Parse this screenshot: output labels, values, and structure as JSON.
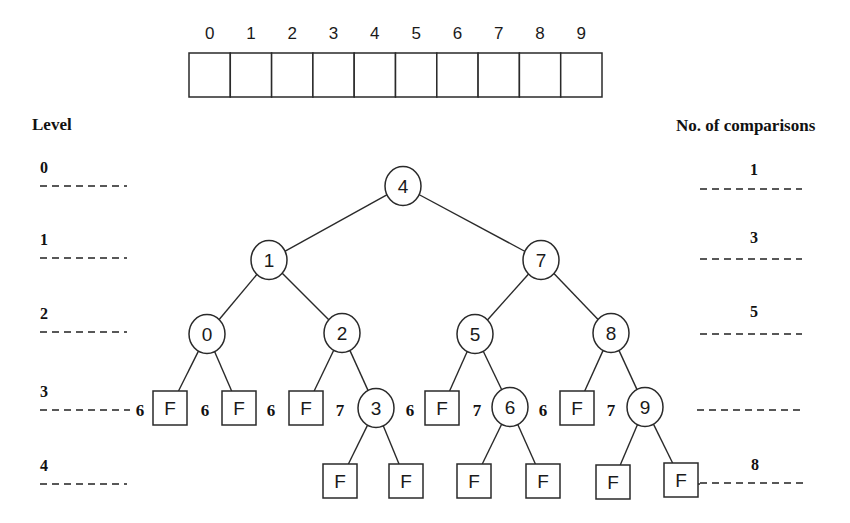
{
  "array": {
    "indices": [
      "0",
      "1",
      "2",
      "3",
      "4",
      "5",
      "6",
      "7",
      "8",
      "9"
    ],
    "x": 189,
    "y": 53,
    "cell_width": 41.3,
    "height": 44,
    "label_y": 39
  },
  "headers": {
    "level": "Level",
    "comparisons": "No. of comparisons"
  },
  "levels": [
    {
      "label": "0",
      "y": 186
    },
    {
      "label": "1",
      "y": 258
    },
    {
      "label": "2",
      "y": 332
    },
    {
      "label": "3",
      "y": 410
    },
    {
      "label": "4",
      "y": 484
    }
  ],
  "comparisons": [
    {
      "label": "1",
      "label_y": 175,
      "line_y": 189,
      "x1": 700,
      "x2": 802
    },
    {
      "label": "3",
      "label_y": 243,
      "line_y": 259,
      "x1": 700,
      "x2": 802
    },
    {
      "label": "5",
      "label_y": 317,
      "line_y": 334,
      "x1": 700,
      "x2": 802
    },
    {
      "label": "",
      "label_y": 0,
      "line_y": 410,
      "x1": 697,
      "x2": 802
    },
    {
      "label": "8",
      "label_y": 470,
      "line_y": 483,
      "x1": 700,
      "x2": 804
    }
  ],
  "tree": {
    "nodes": [
      {
        "id": "4",
        "x": 403,
        "y": 186
      },
      {
        "id": "1",
        "x": 269,
        "y": 260
      },
      {
        "id": "7",
        "x": 541,
        "y": 260
      },
      {
        "id": "0",
        "x": 207,
        "y": 334
      },
      {
        "id": "2",
        "x": 342,
        "y": 333
      },
      {
        "id": "5",
        "x": 475,
        "y": 334
      },
      {
        "id": "8",
        "x": 611,
        "y": 333
      },
      {
        "id": "3",
        "x": 376,
        "y": 408
      },
      {
        "id": "6",
        "x": 510,
        "y": 407
      },
      {
        "id": "9",
        "x": 645,
        "y": 407
      }
    ],
    "failure_nodes": [
      {
        "label": "F",
        "x": 170,
        "y": 408,
        "parent": "0",
        "cost": "6"
      },
      {
        "label": "F",
        "x": 239,
        "y": 408,
        "parent": "0",
        "cost": "6"
      },
      {
        "label": "F",
        "x": 306,
        "y": 408,
        "parent": "2",
        "cost": "6"
      },
      {
        "label": "F",
        "x": 340,
        "y": 481,
        "parent": "3",
        "cost": ""
      },
      {
        "label": "F",
        "x": 406,
        "y": 481,
        "parent": "3",
        "cost": ""
      },
      {
        "label": "F",
        "x": 442,
        "y": 408,
        "parent": "5",
        "cost": "6"
      },
      {
        "label": "F",
        "x": 474,
        "y": 481,
        "parent": "6",
        "cost": ""
      },
      {
        "label": "F",
        "x": 543,
        "y": 481,
        "parent": "6",
        "cost": ""
      },
      {
        "label": "F",
        "x": 577,
        "y": 408,
        "parent": "8",
        "cost": "6"
      },
      {
        "label": "F",
        "x": 613,
        "y": 482,
        "parent": "9",
        "cost": ""
      },
      {
        "label": "F",
        "x": 681,
        "y": 480,
        "parent": "9",
        "cost": ""
      }
    ],
    "edges": [
      [
        "4",
        "1"
      ],
      [
        "4",
        "7"
      ],
      [
        "1",
        "0"
      ],
      [
        "1",
        "2"
      ],
      [
        "7",
        "5"
      ],
      [
        "7",
        "8"
      ],
      [
        "2",
        "3"
      ],
      [
        "5",
        "6"
      ],
      [
        "8",
        "9"
      ]
    ],
    "cost_labels": [
      {
        "text": "6",
        "x": 140,
        "y": 416
      },
      {
        "text": "6",
        "x": 205,
        "y": 416
      },
      {
        "text": "6",
        "x": 271,
        "y": 416
      },
      {
        "text": "7",
        "x": 340,
        "y": 416
      },
      {
        "text": "6",
        "x": 410,
        "y": 416
      },
      {
        "text": "7",
        "x": 477,
        "y": 416
      },
      {
        "text": "6",
        "x": 543,
        "y": 416
      },
      {
        "text": "7",
        "x": 611,
        "y": 416
      }
    ]
  },
  "style": {
    "node_radius": 18,
    "box_size": 34,
    "ink": "#1a1a1a",
    "background": "#ffffff"
  }
}
